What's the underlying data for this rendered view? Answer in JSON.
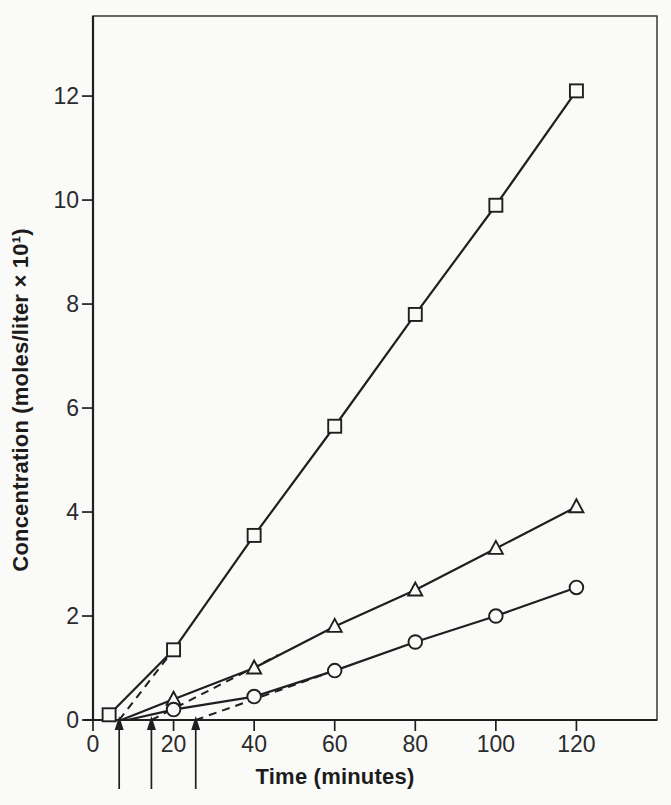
{
  "figure": {
    "kind": "scanned-book-figure",
    "background": "#fafaf8"
  },
  "chart_data": {
    "type": "line",
    "title": "",
    "xlabel": "Time (minutes)",
    "ylabel": "Concentration (moles/liter × 10¹)",
    "xlim": [
      0,
      140
    ],
    "ylim": [
      0,
      13.54
    ],
    "xticks": [
      0,
      20,
      40,
      60,
      80,
      100,
      120
    ],
    "yticks": [
      0,
      2,
      4,
      6,
      8,
      10,
      12
    ],
    "grid": false,
    "legend": "none",
    "frame": "full-box",
    "series": [
      {
        "name": "squares",
        "marker": "square",
        "points": [
          [
            4,
            0.1
          ],
          [
            20,
            1.35
          ],
          [
            40,
            3.55
          ],
          [
            60,
            5.65
          ],
          [
            80,
            7.8
          ],
          [
            100,
            9.9
          ],
          [
            120,
            12.1
          ]
        ]
      },
      {
        "name": "triangles",
        "marker": "triangle",
        "line_origin": [
          7,
          0
        ],
        "points": [
          [
            20,
            0.4
          ],
          [
            40,
            1.0
          ],
          [
            60,
            1.8
          ],
          [
            80,
            2.5
          ],
          [
            100,
            3.3
          ],
          [
            120,
            4.1
          ]
        ]
      },
      {
        "name": "circles",
        "marker": "circle",
        "line_origin": [
          8.5,
          0
        ],
        "points": [
          [
            20,
            0.2
          ],
          [
            40,
            0.45
          ],
          [
            60,
            0.95
          ],
          [
            80,
            1.5
          ],
          [
            100,
            2.0
          ],
          [
            120,
            2.55
          ]
        ]
      }
    ],
    "dashed_extrapolations": [
      {
        "series": "squares",
        "from": [
          6.5,
          0
        ],
        "to": [
          20,
          1.35
        ]
      },
      {
        "series": "triangles",
        "from": [
          14.5,
          0
        ],
        "to": [
          46,
          1.25
        ]
      },
      {
        "series": "circles",
        "from": [
          25.5,
          0
        ],
        "to": [
          60,
          0.95
        ]
      }
    ],
    "lag_arrows": {
      "x_values": [
        6.5,
        14.5,
        25.5
      ]
    },
    "colors": {
      "ink": "#1f1f1f",
      "frame": "#2a2a2a",
      "marker_fill": "#fafaf8",
      "label": "#2b2b2b"
    }
  }
}
